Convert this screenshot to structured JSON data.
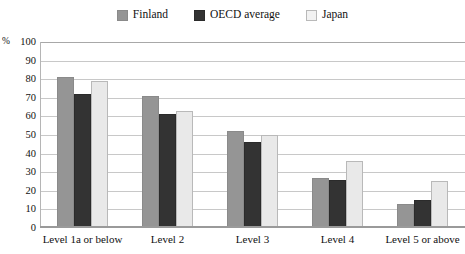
{
  "chart_data": {
    "type": "bar",
    "title": "",
    "subtitle": "",
    "xlabel": "",
    "ylabel": "%",
    "ylim": [
      0,
      100
    ],
    "ytick_labels": [
      "100",
      "90",
      "80",
      "70",
      "60",
      "50",
      "40",
      "30",
      "20",
      "10",
      "0"
    ],
    "yticks": [
      100,
      90,
      80,
      70,
      60,
      50,
      40,
      30,
      20,
      10,
      0
    ],
    "grid": true,
    "legend_position": "top-center",
    "categories": [
      "Level 1a or below",
      "Level 2",
      "Level 3",
      "Level 4",
      "Level 5 or above"
    ],
    "series": [
      {
        "name": "Finland",
        "color": "#959595",
        "values": [
          80,
          70,
          51,
          26,
          12
        ]
      },
      {
        "name": "OECD average",
        "color": "#333333",
        "values": [
          71,
          60,
          45,
          25,
          14
        ]
      },
      {
        "name": "Japan",
        "color": "#e9e9e9",
        "values": [
          78,
          62,
          49,
          35,
          24
        ]
      }
    ]
  },
  "axis": {
    "percent_symbol": "%"
  }
}
